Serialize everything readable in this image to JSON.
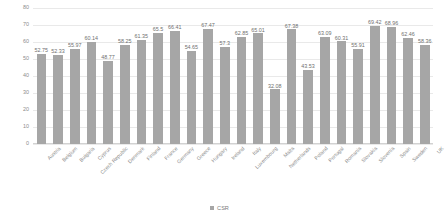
{
  "chart_data": {
    "type": "bar",
    "title": "",
    "xlabel": "",
    "ylabel": "",
    "ylim": [
      0,
      80
    ],
    "yticks": [
      0,
      10,
      20,
      30,
      40,
      50,
      60,
      70,
      80
    ],
    "grid": true,
    "legend_position": "bottom",
    "series_name": "CSR",
    "bar_color": "#a6a6a6",
    "categories": [
      "Austria",
      "Belgium",
      "Bulgaria",
      "Cyprus",
      "Czech Republic",
      "Denmark",
      "Finland",
      "France",
      "Germany",
      "Greece",
      "Hungary",
      "Ireland",
      "Italy",
      "Luxembourg",
      "Malta",
      "Netherlands",
      "Poland",
      "Portugal",
      "Romania",
      "Slovakia",
      "Slovenia",
      "Spain",
      "Sweden",
      "UK"
    ],
    "values": [
      52.75,
      52.33,
      55.97,
      60.14,
      48.77,
      58.25,
      61.35,
      65.5,
      66.41,
      54.65,
      67.47,
      57.3,
      62.85,
      65.01,
      32.08,
      67.38,
      43.53,
      63.09,
      60.31,
      55.91,
      69.42,
      68.96,
      62.46,
      58.36
    ],
    "value_labels": [
      "52.75",
      "52.33",
      "55.97",
      "60.14",
      "48.77",
      "58.25",
      "61.35",
      "65.5",
      "66.41",
      "54.65",
      "67.47",
      "57.3",
      "62.85",
      "65.01",
      "32.08",
      "67.38",
      "43.53",
      "63.09",
      "60.31",
      "55.91",
      "69.42",
      "68.96",
      "62.46",
      "58.36"
    ]
  },
  "legend": {
    "entries": [
      {
        "label": "CSR",
        "color": "#a6a6a6"
      }
    ]
  }
}
